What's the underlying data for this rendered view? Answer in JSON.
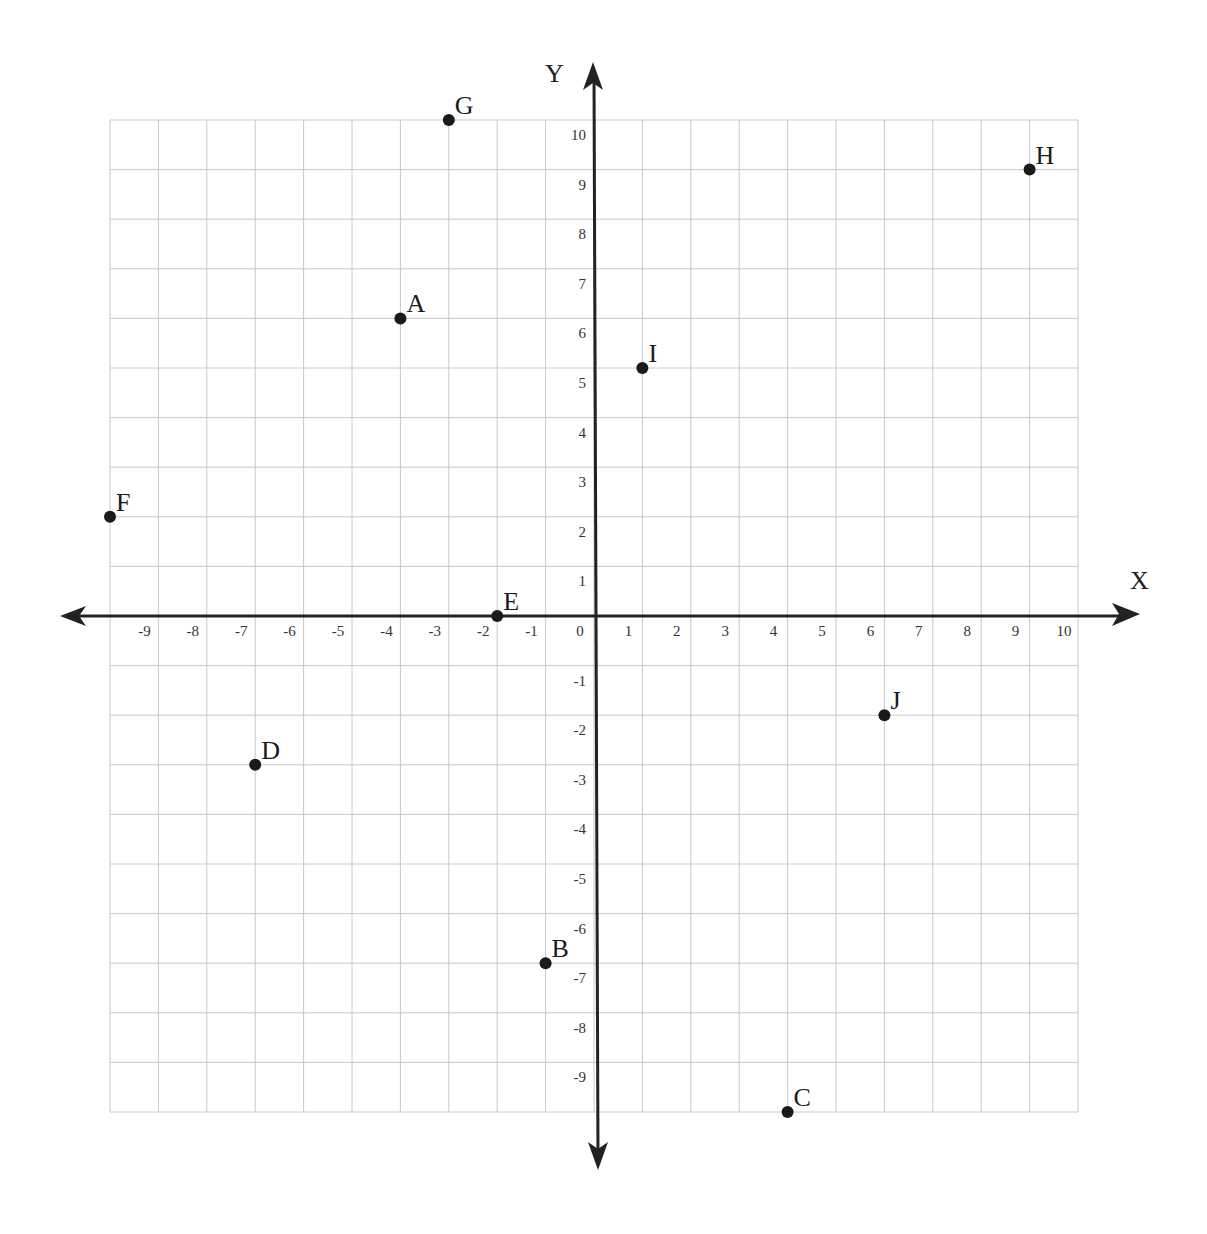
{
  "chart_data": {
    "type": "scatter",
    "title": "",
    "xlabel": "X",
    "ylabel": "Y",
    "xlim": [
      -10,
      10
    ],
    "ylim": [
      -10,
      10
    ],
    "grid": true,
    "legend": null,
    "x_ticks": [
      "-9",
      "-8",
      "-7",
      "-6",
      "-5",
      "-4",
      "-3",
      "-2",
      "-1",
      "0",
      "1",
      "2",
      "3",
      "4",
      "5",
      "6",
      "7",
      "8",
      "9",
      "10"
    ],
    "y_ticks": [
      "10",
      "9",
      "8",
      "7",
      "6",
      "5",
      "4",
      "3",
      "2",
      "1",
      "-1",
      "-2",
      "-3",
      "-4",
      "-5",
      "-6",
      "-7",
      "-8",
      "-9"
    ],
    "points": [
      {
        "label": "A",
        "x": -4,
        "y": 6
      },
      {
        "label": "B",
        "x": -1,
        "y": -7
      },
      {
        "label": "C",
        "x": 4,
        "y": -10
      },
      {
        "label": "D",
        "x": -7,
        "y": -3
      },
      {
        "label": "E",
        "x": -2,
        "y": 0
      },
      {
        "label": "F",
        "x": -10,
        "y": 2
      },
      {
        "label": "G",
        "x": -3,
        "y": 10
      },
      {
        "label": "H",
        "x": 9,
        "y": 9
      },
      {
        "label": "I",
        "x": 1,
        "y": 5
      },
      {
        "label": "J",
        "x": 6,
        "y": -2
      }
    ]
  },
  "colors": {
    "background": "#ffffff",
    "grid": "#c8c8c8",
    "axis": "#222222",
    "point": "#1a1a1a"
  }
}
